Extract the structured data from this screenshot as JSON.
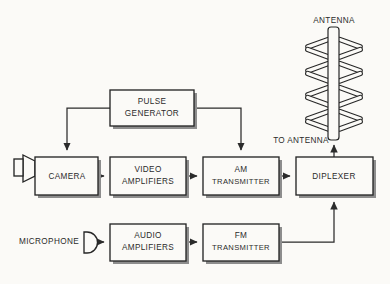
{
  "diagram": {
    "title_text": "Television transmitter block diagram",
    "background_color": "#fbfaf7",
    "line_color": "#2b2b2b",
    "labels": {
      "antenna": "ANTENNA",
      "to_antenna": "TO ANTENNA",
      "microphone": "MICROPHONE"
    },
    "blocks": [
      {
        "id": "pulse-generator",
        "line1": "PULSE",
        "line2": "GENERATOR",
        "x": 110,
        "y": 90,
        "w": 84,
        "h": 36
      },
      {
        "id": "camera",
        "line1": "CAMERA",
        "line2": "",
        "x": 35,
        "y": 157,
        "w": 63,
        "h": 38
      },
      {
        "id": "video-amplifiers",
        "line1": "VIDEO",
        "line2": "AMPLIFIERS",
        "x": 110,
        "y": 157,
        "w": 76,
        "h": 38
      },
      {
        "id": "am-transmitter",
        "line1": "AM",
        "line2": "TRANSMITTER",
        "x": 203,
        "y": 157,
        "w": 76,
        "h": 38
      },
      {
        "id": "diplexer",
        "line1": "DIPLEXER",
        "line2": "",
        "x": 296,
        "y": 157,
        "w": 77,
        "h": 38
      },
      {
        "id": "audio-amplifiers",
        "line1": "AUDIO",
        "line2": "AMPLIFIERS",
        "x": 110,
        "y": 224,
        "w": 76,
        "h": 37
      },
      {
        "id": "fm-transmitter",
        "line1": "FM",
        "line2": "TRANSMITTER",
        "x": 203,
        "y": 224,
        "w": 76,
        "h": 37
      }
    ],
    "signal_paths": [
      {
        "id": "pulse-to-camera",
        "from": "pulse-generator",
        "to": "camera"
      },
      {
        "id": "pulse-to-am",
        "from": "pulse-generator",
        "to": "am-transmitter"
      },
      {
        "id": "camera-to-video",
        "from": "camera",
        "to": "video-amplifiers"
      },
      {
        "id": "video-to-am",
        "from": "video-amplifiers",
        "to": "am-transmitter"
      },
      {
        "id": "am-to-diplexer",
        "from": "am-transmitter",
        "to": "diplexer"
      },
      {
        "id": "mic-to-audio",
        "from": "microphone",
        "to": "audio-amplifiers"
      },
      {
        "id": "audio-to-fm",
        "from": "audio-amplifiers",
        "to": "fm-transmitter"
      },
      {
        "id": "fm-to-diplexer",
        "from": "fm-transmitter",
        "to": "diplexer"
      },
      {
        "id": "diplexer-to-antenna",
        "from": "diplexer",
        "to": "antenna"
      }
    ],
    "antenna": {
      "levels": 4,
      "mast_x": 334
    }
  }
}
